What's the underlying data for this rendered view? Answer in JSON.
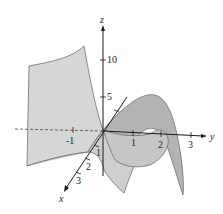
{
  "figure": {
    "type": "3d-surface-plot",
    "colors": {
      "surface_light": "#d4d4d4",
      "surface_mid": "#c2c2c2",
      "surface_dark": "#a9a9a9",
      "edge": "#6e6e6e",
      "axis": "#1a1a1a",
      "background": "#ffffff"
    },
    "axes": {
      "x": {
        "label": "x",
        "ticks": [
          "1",
          "2",
          "3"
        ]
      },
      "y": {
        "label": "y",
        "ticks": [
          "-1",
          "1",
          "2",
          "3"
        ]
      },
      "z": {
        "label": "z",
        "ticks": [
          "5",
          "10"
        ]
      }
    }
  }
}
